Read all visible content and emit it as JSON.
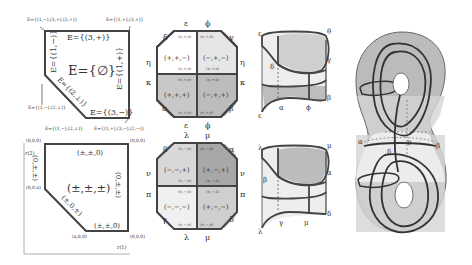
{
  "panel_a": {
    "corner_tl": "E={(1,−),(3,+),(2,+)}",
    "corner_tr": "E={(1,+),(3,+)}",
    "corner_bl": "E={(1,−),(2,⊥)}",
    "corner_bm": "E={(1,−),(2,⊥)}",
    "corner_br": "E={(1,+),(3,−),(2,−)}",
    "top_edge": "E={(3,+)}",
    "left_edge": "E={(1,−)}",
    "right_edge": "E={(1,+)}",
    "diag_edge": "E={(2,⊥)}",
    "bottom_edge": "E={(3,−)}",
    "center": "E={∅}"
  },
  "panel_b": {
    "corner_tl": "(0,0,0)",
    "corner_tr": "(0,0,0)",
    "corner_ml": "(0,0,a)",
    "corner_bm": "(a,0,0)",
    "corner_br": "(0,0,0)",
    "top_edge": "(±,±,0)",
    "left_edge": "(0,±,±)",
    "right_edge": "(0,±,±)",
    "diag_edge": "(±,0,±)",
    "bottom_edge": "(±,±,0)",
    "center": "(±,±,±)",
    "y_axis": "r(2)",
    "x_axis": "r(1)"
  },
  "octagon_top": {
    "labels": {
      "top_l": "ε",
      "top_r": "ϕ",
      "ul": "δ",
      "ur": "γ",
      "left_u": "η",
      "right_u": "η",
      "left_l": "κ",
      "right_l": "κ",
      "ll": "α",
      "lr": "β",
      "bot_l": "ε",
      "bot_r": "ϕ"
    },
    "cells": [
      "(+,+,−)",
      "(−,+,−)",
      "(+,+,+)",
      "(−,+,+)"
    ],
    "edge_small": "(±,+,0)"
  },
  "octagon_bottom": {
    "labels": {
      "top_l": "λ",
      "top_r": "μ",
      "ul": "β",
      "ur": "α",
      "left_u": "ν",
      "right_u": "ν",
      "left_l": "π",
      "right_l": "π",
      "ll": "γ",
      "lr": "δ",
      "bot_l": "λ",
      "bot_r": "μ"
    },
    "cells": [
      "(−,−,+)",
      "(+,−,+)",
      "(−,−,−)",
      "(+,−,−)"
    ],
    "edge_small": "(±,−,0)"
  },
  "cylinder_top": {
    "labels": [
      "ε",
      "θ",
      "γ",
      "δ",
      "α",
      "ϕ",
      "β",
      "ε"
    ]
  },
  "cylinder_bottom": {
    "labels": [
      "λ",
      "μ",
      "α",
      "β",
      "γ",
      "μ",
      "δ",
      "λ"
    ]
  },
  "surface": {
    "labels": [
      "α",
      "δ",
      "γ",
      "β"
    ]
  }
}
